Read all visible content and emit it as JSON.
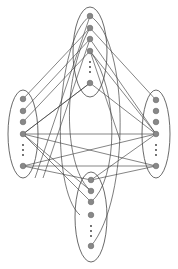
{
  "diagram": {
    "type": "graph",
    "colors": {
      "node_fill": "#888888",
      "line": "#333333",
      "background": "#ffffff"
    },
    "clusters": [
      {
        "id": "top",
        "ellipse": {
          "cx": 90,
          "cy": 52,
          "rx": 17,
          "ry": 45
        },
        "nodes": [
          {
            "x": 90,
            "y": 16
          },
          {
            "x": 90,
            "y": 28
          },
          {
            "x": 90,
            "y": 39
          },
          {
            "x": 90,
            "y": 51
          },
          {
            "x": 90,
            "y": 83
          }
        ],
        "dots": [
          {
            "x": 90,
            "y": 62
          },
          {
            "x": 90,
            "y": 67
          },
          {
            "x": 90,
            "y": 72
          }
        ]
      },
      {
        "id": "left",
        "ellipse": {
          "cx": 23,
          "cy": 134,
          "rx": 15,
          "ry": 44
        },
        "nodes": [
          {
            "x": 23,
            "y": 99
          },
          {
            "x": 23,
            "y": 111
          },
          {
            "x": 23,
            "y": 122
          },
          {
            "x": 23,
            "y": 134
          },
          {
            "x": 23,
            "y": 166
          }
        ],
        "dots": [
          {
            "x": 23,
            "y": 145
          },
          {
            "x": 23,
            "y": 150
          },
          {
            "x": 23,
            "y": 155
          }
        ]
      },
      {
        "id": "right",
        "ellipse": {
          "cx": 156,
          "cy": 134,
          "rx": 14,
          "ry": 44
        },
        "nodes": [
          {
            "x": 156,
            "y": 100
          },
          {
            "x": 156,
            "y": 111
          },
          {
            "x": 156,
            "y": 122
          },
          {
            "x": 156,
            "y": 134
          },
          {
            "x": 156,
            "y": 166
          }
        ],
        "dots": [
          {
            "x": 156,
            "y": 145
          },
          {
            "x": 156,
            "y": 150
          },
          {
            "x": 156,
            "y": 155
          }
        ]
      },
      {
        "id": "bottom",
        "ellipse": {
          "cx": 91,
          "cy": 217,
          "rx": 16,
          "ry": 45
        },
        "nodes": [
          {
            "x": 91,
            "y": 180
          },
          {
            "x": 91,
            "y": 191
          },
          {
            "x": 91,
            "y": 202
          },
          {
            "x": 91,
            "y": 215
          },
          {
            "x": 91,
            "y": 246
          }
        ],
        "dots": [
          {
            "x": 91,
            "y": 226
          },
          {
            "x": 91,
            "y": 231
          },
          {
            "x": 91,
            "y": 236
          }
        ]
      }
    ],
    "edges": [
      [
        90,
        28,
        23,
        99
      ],
      [
        90,
        39,
        23,
        111
      ],
      [
        90,
        51,
        23,
        122
      ],
      [
        90,
        83,
        23,
        134
      ],
      [
        90,
        16,
        35,
        178
      ],
      [
        90,
        39,
        43,
        178
      ],
      [
        90,
        39,
        156,
        134
      ],
      [
        90,
        51,
        156,
        134
      ],
      [
        90,
        28,
        156,
        100
      ],
      [
        90,
        83,
        156,
        134
      ],
      [
        90,
        51,
        120,
        140
      ],
      [
        23,
        134,
        156,
        134
      ],
      [
        23,
        134,
        156,
        166
      ],
      [
        23,
        134,
        91,
        191
      ],
      [
        23,
        134,
        91,
        202
      ],
      [
        23,
        166,
        156,
        166
      ],
      [
        23,
        166,
        91,
        180
      ],
      [
        23,
        134,
        90,
        83
      ],
      [
        156,
        134,
        91,
        180
      ],
      [
        156,
        166,
        91,
        180
      ],
      [
        156,
        134,
        23,
        166
      ]
    ],
    "arcs": [
      "M90 16 C 55 40, 50 190, 80 215",
      "M90 16 C 130 40, 130 200, 91 246",
      "M90 28 C 60 80, 65 170, 91 191",
      "M90 51 C 120 90, 118 180, 91 202"
    ]
  }
}
